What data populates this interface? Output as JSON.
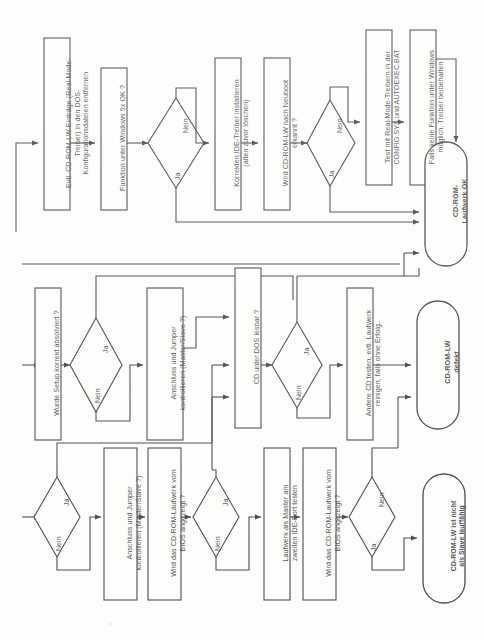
{
  "meta": {
    "language": "de",
    "orientation": "rotated-90-ccw",
    "line_color": "#111111",
    "background_color": "#ffffff"
  },
  "labels": {
    "yes": "Ja",
    "no": "Nein"
  },
  "rows": [
    {
      "id": "row-windows",
      "nodes": [
        {
          "id": "n1-1",
          "type": "process",
          "text": "Evtl. CD-ROM-LW-Einträge (Real-Mode-\nTreiber) in den DOS-\nKonfigurationsdateien entfernen"
        },
        {
          "id": "n1-2",
          "type": "process",
          "text": "Funktion unter Windows 9x OK ?"
        },
        {
          "id": "n1-3",
          "type": "decision",
          "text": "",
          "yes": "Ja",
          "no": "Nein"
        },
        {
          "id": "n1-4",
          "type": "process",
          "text": "Korrekten IDE-Treiber installieren\n(alten zuvor löschen)"
        },
        {
          "id": "n1-5",
          "type": "process",
          "text": "Wird CD-ROM-LW nach Neuboot\nerkannt ?"
        },
        {
          "id": "n1-6",
          "type": "decision",
          "text": "",
          "yes": "Ja",
          "no": "Nein"
        },
        {
          "id": "n1-7",
          "type": "process",
          "text": "Test mit Real-Mode-Treibern in der\nCONFIG.SYS und AUTOEXEC.BAT"
        },
        {
          "id": "n1-8",
          "type": "process",
          "text": "Falls keine Funktion unter Windows\nmöglich, Treiber beibehalten"
        },
        {
          "id": "n1-9",
          "type": "terminator",
          "text": "CD-ROM-\nLaufwerk OK"
        }
      ]
    },
    {
      "id": "row-dos",
      "nodes": [
        {
          "id": "n2-1",
          "type": "process",
          "text": "Wurde Setup korrekt absolviert ?"
        },
        {
          "id": "n2-2",
          "type": "decision",
          "text": "",
          "yes": "Ja",
          "no": "Nein"
        },
        {
          "id": "n2-3",
          "type": "process",
          "text": "Anschluss und Jumper\nkontrollieren (Master/Slave ?)"
        },
        {
          "id": "n2-4",
          "type": "process",
          "text": "CD unter DOS lesbar ?"
        },
        {
          "id": "n2-5",
          "type": "decision",
          "text": "",
          "yes": "Ja",
          "no": "Nein"
        },
        {
          "id": "n2-6",
          "type": "process",
          "text": "Andere CD testen, evtl. Laufwerk\nreinigen, falls ohne Erfolg.."
        },
        {
          "id": "n2-7",
          "type": "terminator",
          "text": "CD-ROM-LW\ndefekt"
        }
      ]
    },
    {
      "id": "row-bios",
      "nodes": [
        {
          "id": "n3-1",
          "type": "decision",
          "text": "",
          "yes": "Ja",
          "no": "Nein"
        },
        {
          "id": "n3-2",
          "type": "process",
          "text": "Anschluss und Jumper\nkontrollieren (Master/Slave ?)"
        },
        {
          "id": "n3-3",
          "type": "process",
          "text": "Wird das CD-ROM-Laufwerk vom\nBIOS angezeigt ?"
        },
        {
          "id": "n3-4",
          "type": "decision",
          "text": "",
          "yes": "Ja",
          "no": "Nein"
        },
        {
          "id": "n3-5",
          "type": "process",
          "text": "Laufwerk als Master am\nzweiten IDE-Port testen"
        },
        {
          "id": "n3-6",
          "type": "process",
          "text": "Wird das CD-ROM-Laufwerk vom\nBIOS angezeigt ?"
        },
        {
          "id": "n3-7",
          "type": "decision",
          "text": "",
          "yes": "Ja",
          "no": "Nein"
        },
        {
          "id": "n3-8",
          "type": "terminator",
          "text": "CD-ROM-LW ist nicht\nals Slave lauffähig"
        }
      ]
    }
  ]
}
